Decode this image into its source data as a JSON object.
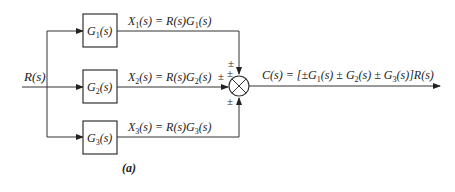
{
  "diagram": {
    "caption": "(a)",
    "input_label": "R(s)",
    "blocks": [
      {
        "id": "G1",
        "name": "G",
        "sub": "1",
        "tail": "(s)",
        "signal": "X",
        "signal_sub": "1",
        "signal_expr_a": "(s) = R(s)G",
        "signal_expr_sub": "1",
        "signal_expr_b": "(s)"
      },
      {
        "id": "G2",
        "name": "G",
        "sub": "2",
        "tail": "(s)",
        "signal": "X",
        "signal_sub": "2",
        "signal_expr_a": "(s) = R(s)G",
        "signal_expr_sub": "2",
        "signal_expr_b": "(s)"
      },
      {
        "id": "G3",
        "name": "G",
        "sub": "3",
        "tail": "(s)",
        "signal": "X",
        "signal_sub": "3",
        "signal_expr_a": "(s) = R(s)G",
        "signal_expr_sub": "3",
        "signal_expr_b": "(s)"
      }
    ],
    "junction": {
      "signs": {
        "top": "±",
        "left": "±",
        "bottom": "±",
        "top_left": "±"
      }
    },
    "output": {
      "lhs": "C(s) = [±G",
      "s1": "1",
      "m1": "(s) ± G",
      "s2": "2",
      "m2": "(s) ± G",
      "s3": "3",
      "m3": "(s)]R(s)"
    },
    "colors": {
      "line": "#333333",
      "text": "#222222"
    }
  }
}
